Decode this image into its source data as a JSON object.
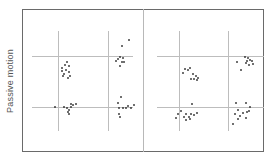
{
  "figure": {
    "y_axis_label": "Passive motion",
    "panels": [
      {
        "id": "left",
        "grid": {
          "vlines_x": [
            58,
            108
          ],
          "hlines_y": [
            56,
            107
          ],
          "v_span": [
            31,
            131
          ],
          "h_span": [
            32,
            133
          ]
        },
        "clusters": [
          {
            "quadrant": "upper-left",
            "points": [
              [
                67,
                62
              ],
              [
                62,
                68
              ],
              [
                65,
                65
              ],
              [
                69,
                66
              ],
              [
                62,
                71
              ],
              [
                66,
                70
              ],
              [
                64,
                74
              ],
              [
                69,
                72
              ],
              [
                70,
                76
              ],
              [
                68,
                78
              ],
              [
                63,
                76
              ]
            ]
          },
          {
            "quadrant": "upper-right",
            "points": [
              [
                129,
                40
              ],
              [
                122,
                46
              ],
              [
                120,
                57
              ],
              [
                118,
                59
              ],
              [
                123,
                58
              ],
              [
                116,
                61
              ],
              [
                120,
                66
              ],
              [
                122,
                62
              ],
              [
                124,
                62
              ]
            ]
          },
          {
            "quadrant": "lower-left",
            "points": [
              [
                55,
                107
              ],
              [
                64,
                107
              ],
              [
                67,
                108
              ],
              [
                71,
                107
              ],
              [
                71,
                104
              ],
              [
                73,
                105
              ],
              [
                76,
                104
              ],
              [
                69,
                110
              ],
              [
                68,
                112
              ],
              [
                69,
                114
              ]
            ]
          },
          {
            "quadrant": "lower-right",
            "points": [
              [
                121,
                97
              ],
              [
                118,
                103
              ],
              [
                119,
                108
              ],
              [
                123,
                108
              ],
              [
                126,
                108
              ],
              [
                128,
                106
              ],
              [
                131,
                108
              ],
              [
                134,
                105
              ],
              [
                119,
                114
              ],
              [
                120,
                117
              ]
            ]
          }
        ]
      },
      {
        "id": "right",
        "grid": {
          "vlines_x": [
            179,
            228
          ],
          "hlines_y": [
            56,
            107
          ],
          "v_span": [
            31,
            131
          ],
          "h_span": [
            157,
            264
          ]
        },
        "clusters": [
          {
            "quadrant": "upper-left",
            "points": [
              [
                185,
                69
              ],
              [
                188,
                70
              ],
              [
                190,
                68
              ],
              [
                183,
                73
              ],
              [
                193,
                74
              ],
              [
                196,
                76
              ],
              [
                198,
                78
              ],
              [
                191,
                79
              ],
              [
                194,
                79
              ],
              [
                197,
                80
              ]
            ]
          },
          {
            "quadrant": "upper-right",
            "points": [
              [
                245,
                57
              ],
              [
                248,
                58
              ],
              [
                250,
                60
              ],
              [
                247,
                61
              ],
              [
                252,
                61
              ],
              [
                246,
                63
              ],
              [
                249,
                65
              ],
              [
                253,
                64
              ],
              [
                237,
                62
              ],
              [
                241,
                70
              ]
            ]
          },
          {
            "quadrant": "lower-left",
            "points": [
              [
                192,
                104
              ],
              [
                181,
                111
              ],
              [
                178,
                114
              ],
              [
                186,
                114
              ],
              [
                191,
                114
              ],
              [
                194,
                115
              ],
              [
                197,
                113
              ],
              [
                189,
                117
              ],
              [
                184,
                117
              ],
              [
                190,
                119
              ],
              [
                186,
                120
              ],
              [
                176,
                118
              ]
            ]
          },
          {
            "quadrant": "lower-right",
            "points": [
              [
                236,
                103
              ],
              [
                246,
                103
              ],
              [
                250,
                107
              ],
              [
                249,
                111
              ],
              [
                247,
                112
              ],
              [
                238,
                110
              ],
              [
                235,
                114
              ],
              [
                243,
                113
              ],
              [
                240,
                116
              ],
              [
                238,
                119
              ],
              [
                246,
                118
              ],
              [
                233,
                124
              ]
            ]
          }
        ]
      }
    ],
    "colors": {
      "frame": "#6a6a6a",
      "grid": "#bdbdbd",
      "dot": "#222222",
      "label": "#555555"
    }
  }
}
